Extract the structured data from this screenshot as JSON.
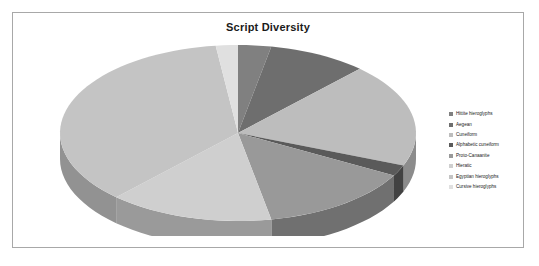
{
  "chart": {
    "title": "Script Diversity",
    "watermark": "contributions toward 2000"
  },
  "legend": {
    "position": "right",
    "items": [
      {
        "label": "Hittite hieroglyphs",
        "color": "#808080"
      },
      {
        "label": "Aegean",
        "color": "#6e6e6e"
      },
      {
        "label": "Cuneiform",
        "color": "#bdbdbd"
      },
      {
        "label": "Alphabetic cuneiform",
        "color": "#5a5a5a"
      },
      {
        "label": "Proto-Canaanite",
        "color": "#999999"
      },
      {
        "label": "Hieratic",
        "color": "#cfcfcf"
      },
      {
        "label": "Egyptian hieroglyphs",
        "color": "#c4c4c4"
      },
      {
        "label": "Cursive hieroglyphs",
        "color": "#e0e0e0"
      }
    ]
  },
  "chart_data": {
    "type": "pie",
    "title": "Script Diversity",
    "xlabel": "",
    "ylabel": "",
    "three_d": true,
    "start_angle_deg": 0,
    "direction": "clockwise",
    "labels": [
      "Hittite hieroglyphs",
      "Aegean",
      "Cuneiform",
      "Alphabetic cuneiform",
      "Proto-Canaanite",
      "Hieratic",
      "Egyptian hieroglyphs",
      "Cursive hieroglyphs"
    ],
    "values": [
      3,
      9,
      19,
      2,
      14,
      15,
      36,
      2
    ],
    "percentages": [
      3,
      9,
      19,
      2,
      14,
      15,
      36,
      2
    ],
    "colors": [
      "#808080",
      "#6e6e6e",
      "#bdbdbd",
      "#5a5a5a",
      "#999999",
      "#cfcfcf",
      "#c4c4c4",
      "#e0e0e0"
    ],
    "side_colors": [
      "#5e5e5e",
      "#515151",
      "#8c8c8c",
      "#424242",
      "#707070",
      "#9a9a9a",
      "#929292",
      "#a6a6a6"
    ],
    "legend": "right",
    "grid": false
  }
}
